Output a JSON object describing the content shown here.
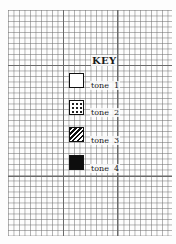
{
  "key": {
    "title": "KEY",
    "items": [
      {
        "label": "tone",
        "number": "1",
        "pattern": "blank"
      },
      {
        "label": "tone",
        "number": "2",
        "pattern": "dotted"
      },
      {
        "label": "tone",
        "number": "3",
        "pattern": "hatched"
      },
      {
        "label": "tone",
        "number": "4",
        "pattern": "solid"
      }
    ]
  },
  "colors": {
    "paper": "#fdfdfd",
    "grid_line": "#8a8a8a",
    "ink": "#111111"
  }
}
